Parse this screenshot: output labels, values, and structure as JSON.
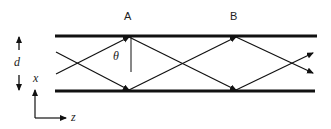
{
  "diagram": {
    "labels": {
      "point_a": "A",
      "point_b": "B",
      "angle": "θ",
      "thickness": "d",
      "axis_x": "x",
      "axis_z": "z"
    },
    "colors": {
      "line": "#111111",
      "background": "#ffffff"
    },
    "geometry": {
      "top_boundary_y": 36,
      "bottom_boundary_y": 91,
      "boundary_x_start": 55,
      "boundary_x_end": 317,
      "reflection_points_top_x": [
        129,
        235
      ],
      "reflection_points_bottom_x": [
        129,
        235
      ]
    }
  }
}
